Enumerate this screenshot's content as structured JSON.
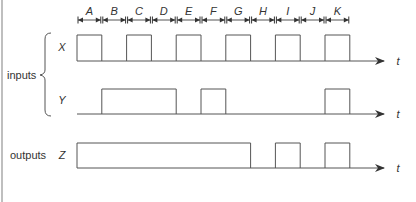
{
  "diagram": {
    "type": "timing-diagram",
    "intervals": [
      "A",
      "B",
      "C",
      "D",
      "E",
      "F",
      "G",
      "H",
      "I",
      "J",
      "K"
    ],
    "group_labels": {
      "inputs": "inputs",
      "outputs": "outputs"
    },
    "axis_label": "t",
    "signals": [
      {
        "name": "X",
        "group": "inputs",
        "high": [
          [
            0,
            1
          ],
          [
            2,
            3
          ],
          [
            4,
            5
          ],
          [
            6,
            7
          ],
          [
            8,
            9
          ],
          [
            10,
            11
          ]
        ]
      },
      {
        "name": "Y",
        "group": "inputs",
        "high": [
          [
            1,
            4
          ],
          [
            5,
            6
          ],
          [
            10,
            11
          ]
        ]
      },
      {
        "name": "Z",
        "group": "outputs",
        "high": [
          [
            0,
            7
          ],
          [
            8,
            9
          ],
          [
            10,
            11
          ]
        ]
      }
    ],
    "colors": {
      "line": "#555555",
      "text": "#333333",
      "border": "#999999"
    }
  }
}
